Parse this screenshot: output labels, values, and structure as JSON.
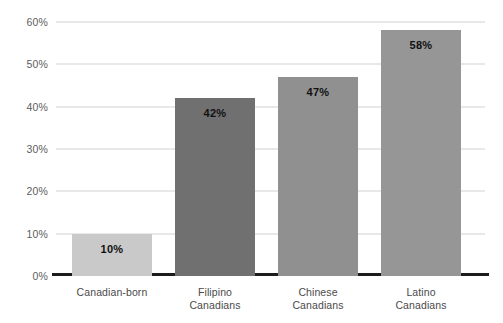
{
  "chart_data": {
    "type": "bar",
    "title": "",
    "subtitle": "",
    "xlabel": "",
    "ylabel": "",
    "categories": [
      "Canadian-born",
      "Filipino Canadians",
      "Chinese Canadians",
      "Latino Canadians"
    ],
    "category_lines": [
      [
        "Canadian-born"
      ],
      [
        "Filipino",
        "Canadians"
      ],
      [
        "Chinese",
        "Canadians"
      ],
      [
        "Latino",
        "Canadians"
      ]
    ],
    "values": [
      10,
      42,
      47,
      58
    ],
    "value_labels": [
      "10%",
      "42%",
      "47%",
      "58%"
    ],
    "bar_colors": [
      "#c9c9c9",
      "#707070",
      "#909090",
      "#969696"
    ],
    "ylim": [
      0,
      60
    ],
    "ytick_values": [
      0,
      10,
      20,
      30,
      40,
      50,
      60
    ],
    "ytick_labels": [
      "0%",
      "10%",
      "20%",
      "30%",
      "40%",
      "50%",
      "60%"
    ],
    "grid": true,
    "legend": false,
    "legend_position": "none",
    "axis_line_color": "#1c1c1c",
    "gridline_color": "#d2d2d2",
    "label_text_color": "#4a4a4a",
    "value_text_color": "#111111"
  }
}
